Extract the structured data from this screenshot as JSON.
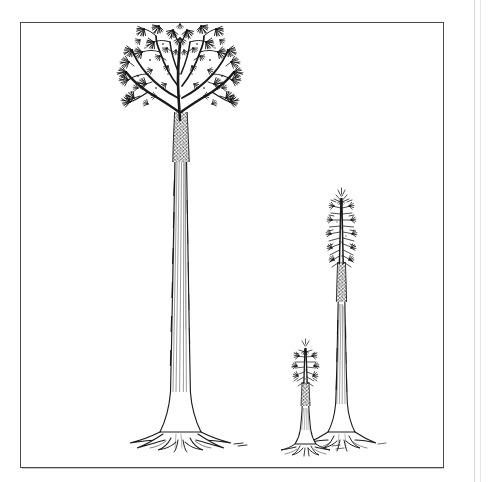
{
  "figure": {
    "domain": "scientific-illustration",
    "medium": "black-and-white pen-and-ink line drawing, scanned from a printed page",
    "subject": "Three fossil lycopsid (Lepidodendron-type) trees shown at three growth stages, drawn to a common scale",
    "caption": "",
    "title": "",
    "background_color": "#ffffff",
    "ink_color": "#1a1a1a",
    "frame": {
      "shape": "rectangle",
      "stroke_color": "#4a4a4a",
      "stroke_width_px": 1,
      "x": 20,
      "y": 22,
      "width": 424,
      "height": 446
    },
    "page_edge": {
      "visible": true,
      "side": "right",
      "color": "#d9d9d9"
    },
    "ground_line_y": 448
  },
  "specimens": [
    {
      "id": "large-tree",
      "label": "mature tree with full branched crown",
      "stage": "mature",
      "position": "left",
      "crown_type": "broad dichotomously branched canopy with dense leafy tufts",
      "trunk": "tall slender columnar trunk with fine vertical hatching",
      "base": "flared buttressed stigmarian root system",
      "apex_y": 35,
      "base_y": 448,
      "height_px": 413,
      "crown_left_x": 116,
      "crown_right_x": 236,
      "crown_bottom_y": 128,
      "trunk_center_x": 180,
      "trunk_width_px": 11,
      "relative_height": 1.0
    },
    {
      "id": "medium-tree",
      "label": "sub-adult unbranched tree with terminal leaf crown",
      "stage": "sub-adult",
      "position": "right",
      "crown_type": "narrow spiky unbranched plume of leaves along the upper stem",
      "trunk": "slender unbranched pole with vertical hatching",
      "base": "small flared buttressed root system",
      "apex_y": 198,
      "base_y": 448,
      "height_px": 250,
      "crown_left_x": 328,
      "crown_right_x": 353,
      "crown_bottom_y": 300,
      "trunk_center_x": 341,
      "trunk_width_px": 8,
      "relative_height": 0.61
    },
    {
      "id": "small-tree",
      "label": "juvenile unbranched sapling with leafy shoot",
      "stage": "juvenile",
      "position": "centre-right",
      "crown_type": "short bristly leaf-covered shoot",
      "trunk": "short stout stem",
      "base": "small flared root base",
      "apex_y": 348,
      "base_y": 448,
      "height_px": 100,
      "crown_left_x": 295,
      "crown_right_x": 315,
      "crown_bottom_y": 404,
      "trunk_center_x": 305,
      "trunk_width_px": 7,
      "relative_height": 0.24
    }
  ]
}
